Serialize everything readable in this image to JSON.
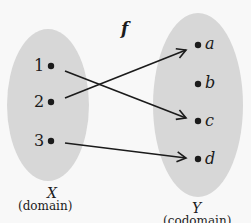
{
  "diagram": {
    "function_label": "f",
    "domain": {
      "name": "X",
      "caption": "(domain)",
      "elements": [
        "1",
        "2",
        "3"
      ],
      "fill": "#d7d7d7"
    },
    "codomain": {
      "name": "Y",
      "caption": "(codomain)",
      "elements": [
        "a",
        "b",
        "c",
        "d"
      ],
      "fill": "#d7d7d7"
    },
    "mappings": [
      {
        "from": "1",
        "to": "c"
      },
      {
        "from": "2",
        "to": "a"
      },
      {
        "from": "3",
        "to": "d"
      }
    ],
    "colors": {
      "background": "#f8f8f8",
      "ink": "#1b1b1b",
      "set_fill": "#d7d7d7"
    }
  }
}
